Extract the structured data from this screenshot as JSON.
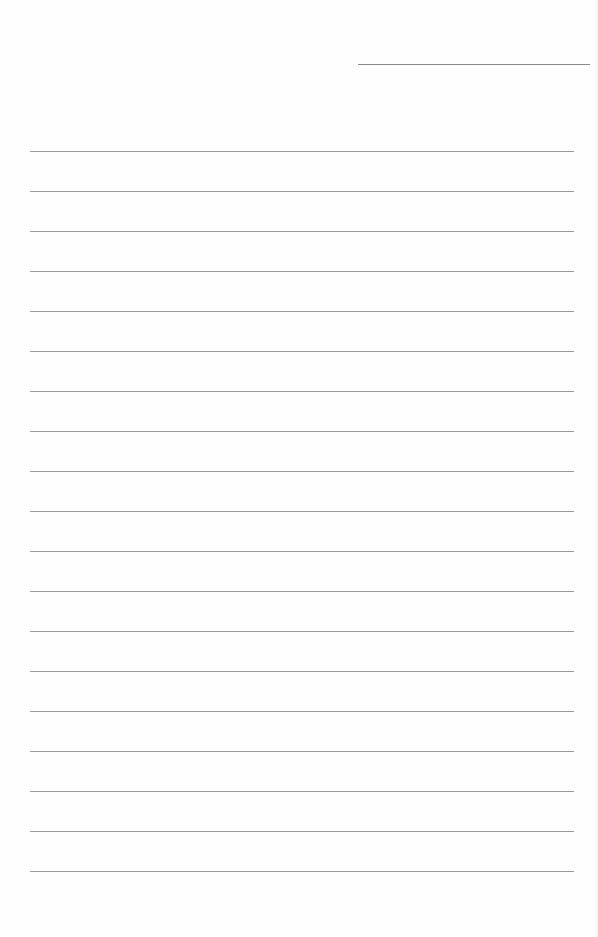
{
  "document": {
    "type": "lined-paper",
    "header_line": {
      "x": 358,
      "y": 64,
      "width": 232,
      "color": "#8a8a8a"
    },
    "rules": {
      "count": 19,
      "first_y": 151,
      "spacing": 40,
      "x": 30,
      "width": 544,
      "color": "#9a9a9a"
    }
  }
}
